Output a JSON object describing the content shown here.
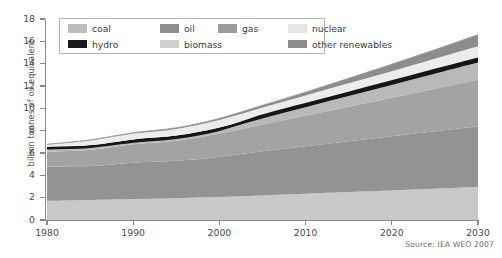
{
  "chart_data": {
    "type": "area",
    "title": "",
    "xlabel": "",
    "ylabel": "billion tonnes of oil equivalent",
    "xlim": [
      1980,
      2030
    ],
    "ylim": [
      0,
      18
    ],
    "ytick_values": [
      0,
      2,
      4,
      6,
      8,
      10,
      12,
      14,
      16,
      18
    ],
    "ytick_labels": [
      "0",
      "2",
      "4",
      "6",
      "8",
      "10",
      "12",
      "14",
      "16",
      "18"
    ],
    "xtick_values": [
      1980,
      1990,
      2000,
      2010,
      2020,
      2030
    ],
    "xtick_labels": [
      "1980",
      "1990",
      "2000",
      "2010",
      "2020",
      "2030"
    ],
    "grid": false,
    "legend_position": "top-left-inside",
    "stack_order_bottom_to_top": [
      "biomass",
      "oil",
      "gas",
      "coal",
      "hydro",
      "nuclear",
      "other renewables"
    ],
    "x": [
      1980,
      1985,
      1990,
      1995,
      2000,
      2005,
      2010,
      2015,
      2020,
      2025,
      2030
    ],
    "series": [
      {
        "name": "biomass",
        "color": "#c9c9c9",
        "values": [
          1.7,
          1.78,
          1.88,
          1.95,
          2.05,
          2.2,
          2.35,
          2.5,
          2.65,
          2.8,
          2.95
        ]
      },
      {
        "name": "oil",
        "color": "#939393",
        "values": [
          3.1,
          3.05,
          3.25,
          3.35,
          3.6,
          3.95,
          4.25,
          4.55,
          4.85,
          5.15,
          5.45
        ]
      },
      {
        "name": "gas",
        "color": "#a3a3a3",
        "values": [
          1.3,
          1.45,
          1.65,
          1.8,
          2.1,
          2.4,
          2.75,
          3.1,
          3.45,
          3.8,
          4.15
        ]
      },
      {
        "name": "coal",
        "color": "#b9b9b9",
        "values": [
          0.25,
          0.22,
          0.24,
          0.25,
          0.3,
          0.55,
          0.75,
          0.95,
          1.15,
          1.35,
          1.55
        ]
      },
      {
        "name": "hydro",
        "color": "#161616",
        "values": [
          0.18,
          0.19,
          0.2,
          0.21,
          0.23,
          0.25,
          0.27,
          0.29,
          0.31,
          0.33,
          0.35
        ]
      },
      {
        "name": "nuclear",
        "color": "#ececec",
        "values": [
          0.2,
          0.42,
          0.52,
          0.6,
          0.68,
          0.72,
          0.78,
          0.85,
          0.92,
          1.0,
          1.1
        ]
      },
      {
        "name": "other renewables",
        "color": "#8c8c8c",
        "values": [
          0.05,
          0.06,
          0.08,
          0.1,
          0.14,
          0.2,
          0.3,
          0.45,
          0.62,
          0.82,
          1.05
        ]
      }
    ],
    "totals": [
      6.78,
      7.17,
      7.82,
      8.26,
      9.1,
      10.27,
      11.45,
      12.69,
      13.95,
      15.25,
      16.6
    ],
    "hydro_line_values": [
      6.43,
      6.56,
      7.02,
      7.36,
      8.08,
      9.35,
      10.37,
      11.39,
      12.41,
      13.43,
      14.45
    ]
  },
  "legend": {
    "row1": [
      {
        "label": "coal",
        "color": "#bdbdbd"
      },
      {
        "label": "oil",
        "color": "#8e8e8e"
      },
      {
        "label": "gas",
        "color": "#9b9b9b"
      },
      {
        "label": "nuclear",
        "color": "#e6e6e6"
      }
    ],
    "row2": [
      {
        "label": "hydro",
        "color": "#1a1a1a"
      },
      {
        "label": "biomass",
        "color": "#cfcfcf"
      },
      {
        "label": "other renewables",
        "color": "#8c8c8c"
      }
    ]
  },
  "axis": {
    "y_title": "billion tonnes of oil equivalent"
  },
  "footer": {
    "source": "Source: IEA WEO 2007"
  }
}
